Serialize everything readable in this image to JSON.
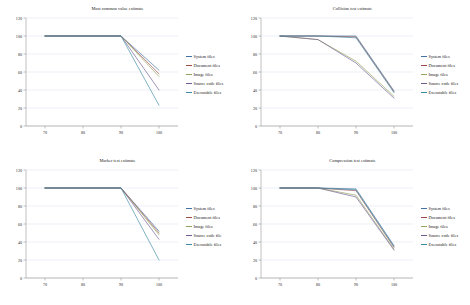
{
  "figure": {
    "background": "#ffffff",
    "panel_count": 4,
    "grid": "2x2"
  },
  "series_colors": {
    "system": "#4472a8",
    "document": "#9b4a46",
    "image": "#8fa35a",
    "source": "#6f5a92",
    "executable": "#3d8aa3"
  },
  "axis": {
    "x_ticks": [
      "70",
      "80",
      "90",
      "100"
    ],
    "x_values": [
      70,
      80,
      90,
      100
    ],
    "y_ticks": [
      "0",
      "20",
      "40",
      "60",
      "80",
      "100",
      "120"
    ],
    "y_values": [
      0,
      20,
      40,
      60,
      80,
      100,
      120
    ],
    "xlim": [
      65,
      105
    ],
    "ylim": [
      0,
      120
    ]
  },
  "chart_data": [
    {
      "type": "line",
      "title": "Most common value estimate",
      "xlabel": "",
      "ylabel": "",
      "x": [
        70,
        80,
        90,
        100
      ],
      "xlim": [
        65,
        105
      ],
      "ylim": [
        0,
        120
      ],
      "grid": true,
      "legend_position": "right",
      "series": [
        {
          "name": "System files",
          "values": [
            100,
            100,
            100,
            62
          ]
        },
        {
          "name": "Document files",
          "values": [
            100,
            100,
            100,
            58
          ]
        },
        {
          "name": "Image files",
          "values": [
            100,
            100,
            100,
            55
          ]
        },
        {
          "name": "Source code files",
          "values": [
            100,
            100,
            100,
            40
          ]
        },
        {
          "name": "Executable files",
          "values": [
            100,
            100,
            100,
            23
          ]
        }
      ]
    },
    {
      "type": "line",
      "title": "Collision test estimate",
      "xlabel": "",
      "ylabel": "",
      "x": [
        70,
        80,
        90,
        100
      ],
      "xlim": [
        65,
        105
      ],
      "ylim": [
        0,
        120
      ],
      "grid": true,
      "legend_position": "right",
      "series": [
        {
          "name": "System files",
          "values": [
            100,
            100,
            100,
            39
          ]
        },
        {
          "name": "Document files",
          "values": [
            100,
            100,
            99,
            38
          ]
        },
        {
          "name": "Image files",
          "values": [
            100,
            96,
            72,
            33
          ]
        },
        {
          "name": "Source code files",
          "values": [
            100,
            96,
            70,
            31
          ]
        },
        {
          "name": "Executable files",
          "values": [
            100,
            100,
            98,
            37
          ]
        }
      ]
    },
    {
      "type": "line",
      "title": "Marker test estimate",
      "xlabel": "",
      "ylabel": "",
      "x": [
        70,
        80,
        90,
        100
      ],
      "xlim": [
        65,
        105
      ],
      "ylim": [
        0,
        120
      ],
      "grid": true,
      "legend_position": "right",
      "series": [
        {
          "name": "System files",
          "values": [
            100,
            100,
            100,
            52
          ]
        },
        {
          "name": "Document files",
          "values": [
            100,
            100,
            100,
            50
          ]
        },
        {
          "name": "Image files",
          "values": [
            100,
            100,
            100,
            48
          ]
        },
        {
          "name": "Source code file",
          "values": [
            100,
            100,
            100,
            43
          ]
        },
        {
          "name": "Executable files",
          "values": [
            100,
            100,
            100,
            20
          ]
        }
      ]
    },
    {
      "type": "line",
      "title": "Compression test estimate",
      "xlabel": "",
      "ylabel": "",
      "x": [
        70,
        80,
        90,
        100
      ],
      "xlim": [
        65,
        105
      ],
      "ylim": [
        0,
        120
      ],
      "grid": true,
      "legend_position": "right",
      "series": [
        {
          "name": "System files",
          "values": [
            100,
            100,
            99,
            36
          ]
        },
        {
          "name": "Document files",
          "values": [
            100,
            100,
            97,
            34
          ]
        },
        {
          "name": "Image files",
          "values": [
            100,
            100,
            92,
            32
          ]
        },
        {
          "name": "Source code files",
          "values": [
            100,
            100,
            90,
            31
          ]
        },
        {
          "name": "Executable files",
          "values": [
            100,
            100,
            98,
            35
          ]
        }
      ]
    }
  ]
}
